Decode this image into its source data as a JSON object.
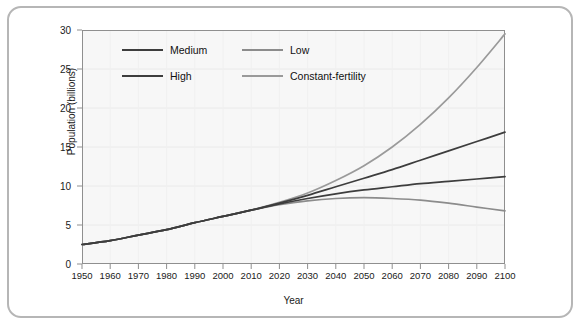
{
  "chart_data": {
    "type": "line",
    "title": "",
    "subtitle": "",
    "xlabel": "Year",
    "ylabel": "Population (billions)",
    "xlim": [
      1950,
      2100
    ],
    "ylim": [
      0,
      30
    ],
    "xticks": [
      1950,
      1960,
      1970,
      1980,
      1990,
      2000,
      2010,
      2020,
      2030,
      2040,
      2050,
      2060,
      2070,
      2080,
      2090,
      2100
    ],
    "yticks": [
      0,
      5,
      10,
      15,
      20,
      25,
      30
    ],
    "grid": false,
    "legend_position": "top-left",
    "x": [
      1950,
      1960,
      1970,
      1980,
      1990,
      2000,
      2010,
      2020,
      2030,
      2040,
      2050,
      2060,
      2070,
      2080,
      2090,
      2100
    ],
    "series": [
      {
        "name": "Medium",
        "color": "#3d3d3d",
        "values": [
          2.5,
          3.0,
          3.7,
          4.4,
          5.3,
          6.1,
          6.9,
          7.7,
          8.4,
          9.0,
          9.5,
          9.9,
          10.3,
          10.6,
          10.9,
          11.2
        ]
      },
      {
        "name": "High",
        "color": "#3d3d3d",
        "values": [
          2.5,
          3.0,
          3.7,
          4.4,
          5.3,
          6.1,
          6.9,
          7.8,
          8.8,
          9.9,
          11.0,
          12.1,
          13.3,
          14.5,
          15.7,
          16.9
        ]
      },
      {
        "name": "Low",
        "color": "#8c8c8c",
        "values": [
          2.5,
          3.0,
          3.7,
          4.4,
          5.3,
          6.1,
          6.9,
          7.6,
          8.1,
          8.4,
          8.5,
          8.4,
          8.2,
          7.8,
          7.3,
          6.8
        ]
      },
      {
        "name": "Constant-fertility",
        "color": "#9a9a9a",
        "values": [
          2.5,
          3.0,
          3.7,
          4.4,
          5.3,
          6.1,
          6.9,
          7.9,
          9.1,
          10.7,
          12.6,
          15.0,
          17.9,
          21.3,
          25.2,
          29.5
        ]
      }
    ],
    "legend_entries": [
      {
        "label": "Medium",
        "color": "#3d3d3d"
      },
      {
        "label": "Low",
        "color": "#8c8c8c"
      },
      {
        "label": "High",
        "color": "#3d3d3d"
      },
      {
        "label": "Constant-fertility",
        "color": "#9a9a9a"
      }
    ]
  }
}
